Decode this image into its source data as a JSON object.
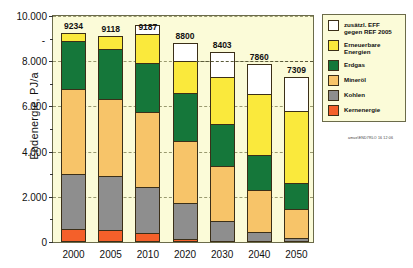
{
  "chart_data": {
    "type": "bar",
    "stacked": true,
    "title": "",
    "xlabel": "",
    "ylabel": "Endenergie, PJ/a",
    "ylim": [
      0,
      10000
    ],
    "yticks": [
      "0",
      "2.000",
      "4.000",
      "6.000",
      "8.000",
      "10.000"
    ],
    "ytick_values": [
      0,
      2000,
      4000,
      6000,
      8000,
      10000
    ],
    "grid": true,
    "legend_position": "right",
    "categories": [
      "2000",
      "2005",
      "2010",
      "2020",
      "2030",
      "2040",
      "2050"
    ],
    "totals": [
      9234,
      9118,
      9187,
      8800,
      8403,
      7860,
      7309
    ],
    "reference_line": {
      "value": 8000,
      "label": "7860",
      "style": "dashed"
    },
    "series": [
      {
        "name": "Kernenergie",
        "color": "#F4602A",
        "values": [
          560,
          520,
          420,
          130,
          0,
          0,
          0
        ]
      },
      {
        "name": "Kohlen",
        "color": "#8E8E8E",
        "values": [
          2450,
          2380,
          2000,
          1610,
          950,
          450,
          180
        ]
      },
      {
        "name": "Mineröl",
        "color": "#F7C469",
        "values": [
          3780,
          3420,
          3320,
          2710,
          2400,
          1860,
          1300
        ]
      },
      {
        "name": "Erdgas",
        "color": "#15773A",
        "values": [
          2110,
          2240,
          2160,
          2130,
          1890,
          1560,
          1140
        ]
      },
      {
        "name": "Erneuerbare Energien",
        "color": "#FAE93C",
        "values": [
          334,
          558,
          1287,
          1420,
          2080,
          2680,
          3170
        ]
      },
      {
        "name": "zusätzl. EFF gegen REF 2005",
        "color": "#FFFFFF",
        "values": [
          0,
          0,
          420,
          800,
          1080,
          1310,
          1520
        ]
      }
    ]
  },
  "legend": {
    "items": [
      {
        "label": "zusätzl. EFF\ngegen REF 2005",
        "color": "#FFFFFF"
      },
      {
        "label": "Erneuerbare\nEnergien",
        "color": "#FAE93C"
      },
      {
        "label": "Erdgas",
        "color": "#15773A"
      },
      {
        "label": "Mineröl",
        "color": "#F7C469"
      },
      {
        "label": "Kohlen",
        "color": "#8E8E8E"
      },
      {
        "label": "Kernenergie",
        "color": "#F4602A"
      }
    ]
  },
  "axis": {
    "y_title": "Endenergie, PJ/a",
    "dot_marker": "-"
  },
  "source_stamp": "amue\\END7RLO 16 12:06",
  "colors": {
    "plot_background": "#FBFBD8",
    "frame": "#6B6B4A",
    "gridline": "#9A9A70",
    "segment_border": "#3B2F18"
  }
}
